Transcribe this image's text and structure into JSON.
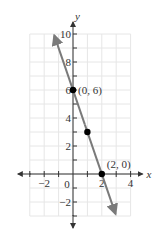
{
  "chart_data": {
    "type": "line",
    "title": "",
    "xlabel": "x",
    "ylabel": "y",
    "xlim": [
      -3,
      4
    ],
    "ylim": [
      -3,
      10
    ],
    "grid": true,
    "x_ticks": [
      {
        "value": -2,
        "label": "−2"
      },
      {
        "value": 2,
        "label": "2"
      },
      {
        "value": 4,
        "label": "4"
      }
    ],
    "origin_label": "0",
    "y_ticks": [
      {
        "value": 10,
        "label": "10"
      },
      {
        "value": 8,
        "label": "8"
      },
      {
        "value": 6,
        "label": "6"
      },
      {
        "value": 4,
        "label": "4"
      },
      {
        "value": 2,
        "label": "2"
      },
      {
        "value": -2,
        "label": "−2"
      }
    ],
    "series": [
      {
        "name": "y = -3x + 6",
        "color": "#7a7a7a",
        "slope": -3,
        "intercept": 6,
        "x_range": [
          -1.3,
          2.95
        ]
      }
    ],
    "points": [
      {
        "x": 0,
        "y": 6,
        "label": "(0, 6)"
      },
      {
        "x": 1,
        "y": 3,
        "label": ""
      },
      {
        "x": 2,
        "y": 0,
        "label": "(2, 0)"
      }
    ]
  }
}
